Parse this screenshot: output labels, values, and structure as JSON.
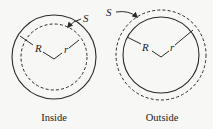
{
  "figure": {
    "panels": [
      {
        "id": "inside",
        "caption": "Inside",
        "labels": {
          "surface": "S",
          "big_radius": "R",
          "small_radius": "r"
        },
        "solid_circle": {
          "cx": 54,
          "cy": 57,
          "r": 42
        },
        "dashed_circle": {
          "cx": 54,
          "cy": 57,
          "r": 33
        }
      },
      {
        "id": "outside",
        "caption": "Outside",
        "labels": {
          "surface": "S",
          "big_radius": "R",
          "small_radius": "r"
        },
        "solid_circle": {
          "cx": 161,
          "cy": 55,
          "r": 38
        },
        "dashed_circle": {
          "cx": 161,
          "cy": 55,
          "r": 45
        }
      }
    ],
    "colors": {
      "stroke": "#2a2a2a",
      "background": "#f7f7f5"
    }
  }
}
